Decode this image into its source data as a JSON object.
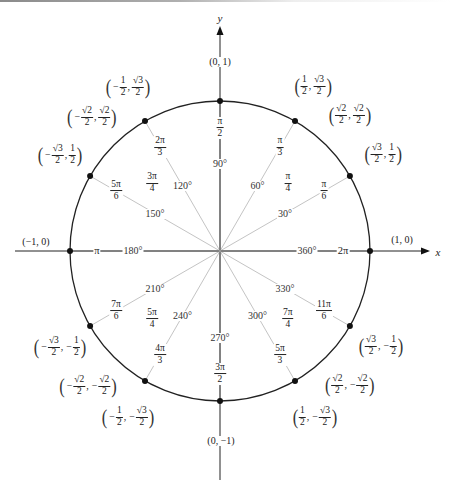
{
  "diagram": {
    "center": {
      "x": 220,
      "y": 251
    },
    "radius": 150,
    "colors": {
      "circle": "#222222",
      "axis": "#222222",
      "radius_line": "#c4c4c4",
      "dot": "#111111",
      "text": "#222222"
    },
    "axes": {
      "x_label": "x",
      "y_label": "y",
      "x_label_pos": {
        "x": 438,
        "y": 252
      },
      "y_label_pos": {
        "x": 220,
        "y": 18
      }
    },
    "axis_points": [
      {
        "label": "(0, 1)",
        "x": 220,
        "y": 62
      },
      {
        "label": "(1, 0)",
        "x": 402,
        "y": 240
      },
      {
        "label": "(0, −1)",
        "x": 221,
        "y": 441
      },
      {
        "label": "(−1, 0)",
        "x": 36,
        "y": 242
      }
    ],
    "angles": [
      {
        "deg": 0,
        "deg_label": "360°",
        "rad_num": "2π",
        "rad_den": "",
        "dot": true
      },
      {
        "deg": 30,
        "deg_label": "30°",
        "rad_num": "π",
        "rad_den": "6",
        "dot": true
      },
      {
        "deg": 45,
        "deg_label": "",
        "rad_num": "π",
        "rad_den": "4",
        "dot": false
      },
      {
        "deg": 60,
        "deg_label": "60°",
        "rad_num": "π",
        "rad_den": "3",
        "dot": true
      },
      {
        "deg": 90,
        "deg_label": "90°",
        "rad_num": "π",
        "rad_den": "2",
        "dot": true
      },
      {
        "deg": 120,
        "deg_label": "120°",
        "rad_num": "2π",
        "rad_den": "3",
        "dot": true
      },
      {
        "deg": 135,
        "deg_label": "",
        "rad_num": "3π",
        "rad_den": "4",
        "dot": false
      },
      {
        "deg": 150,
        "deg_label": "150°",
        "rad_num": "5π",
        "rad_den": "6",
        "dot": true
      },
      {
        "deg": 180,
        "deg_label": "180°",
        "rad_num": "π",
        "rad_den": "",
        "dot": true
      },
      {
        "deg": 210,
        "deg_label": "210°",
        "rad_num": "7π",
        "rad_den": "6",
        "dot": true
      },
      {
        "deg": 225,
        "deg_label": "",
        "rad_num": "5π",
        "rad_den": "4",
        "dot": false
      },
      {
        "deg": 240,
        "deg_label": "240°",
        "rad_num": "4π",
        "rad_den": "3",
        "dot": true
      },
      {
        "deg": 270,
        "deg_label": "270°",
        "rad_num": "3π",
        "rad_den": "2",
        "dot": true
      },
      {
        "deg": 300,
        "deg_label": "300°",
        "rad_num": "5π",
        "rad_den": "3",
        "dot": true
      },
      {
        "deg": 315,
        "deg_label": "",
        "rad_num": "7π",
        "rad_den": "4",
        "dot": false
      },
      {
        "deg": 330,
        "deg_label": "330°",
        "rad_num": "11π",
        "rad_den": "6",
        "dot": true
      }
    ],
    "coordinates": [
      {
        "angle": 30,
        "x_sign": "",
        "x_num": "√3",
        "x_den": "2",
        "y_sign": "",
        "y_num": "1",
        "y_den": "2",
        "pos": {
          "x": 383,
          "y": 154
        }
      },
      {
        "angle": 45,
        "x_sign": "",
        "x_num": "√2",
        "x_den": "2",
        "y_sign": "",
        "y_num": "√2",
        "y_den": "2",
        "pos": {
          "x": 350,
          "y": 115
        }
      },
      {
        "angle": 60,
        "x_sign": "",
        "x_num": "1",
        "x_den": "2",
        "y_sign": "",
        "y_num": "√3",
        "y_den": "2",
        "pos": {
          "x": 313,
          "y": 86
        }
      },
      {
        "angle": 120,
        "x_sign": "−",
        "x_num": "1",
        "x_den": "2",
        "y_sign": "",
        "y_num": "√3",
        "y_den": "2",
        "pos": {
          "x": 128,
          "y": 87
        }
      },
      {
        "angle": 135,
        "x_sign": "−",
        "x_num": "√2",
        "x_den": "2",
        "y_sign": "",
        "y_num": "√2",
        "y_den": "2",
        "pos": {
          "x": 92,
          "y": 117
        }
      },
      {
        "angle": 150,
        "x_sign": "−",
        "x_num": "√3",
        "x_den": "2",
        "y_sign": "",
        "y_num": "1",
        "y_den": "2",
        "pos": {
          "x": 60,
          "y": 155
        }
      },
      {
        "angle": 210,
        "x_sign": "−",
        "x_num": "√3",
        "x_den": "2",
        "y_sign": "−",
        "y_num": "1",
        "y_den": "2",
        "pos": {
          "x": 60,
          "y": 347
        }
      },
      {
        "angle": 225,
        "x_sign": "−",
        "x_num": "√2",
        "x_den": "2",
        "y_sign": "−",
        "y_num": "√2",
        "y_den": "2",
        "pos": {
          "x": 88,
          "y": 386
        }
      },
      {
        "angle": 240,
        "x_sign": "−",
        "x_num": "1",
        "x_den": "2",
        "y_sign": "−",
        "y_num": "√3",
        "y_den": "2",
        "pos": {
          "x": 128,
          "y": 417
        }
      },
      {
        "angle": 300,
        "x_sign": "",
        "x_num": "1",
        "x_den": "2",
        "y_sign": "−",
        "y_num": "√3",
        "y_den": "2",
        "pos": {
          "x": 315,
          "y": 417
        }
      },
      {
        "angle": 315,
        "x_sign": "",
        "x_num": "√2",
        "x_den": "2",
        "y_sign": "−",
        "y_num": "√2",
        "y_den": "2",
        "pos": {
          "x": 350,
          "y": 385
        }
      },
      {
        "angle": 330,
        "x_sign": "",
        "x_num": "√3",
        "x_den": "2",
        "y_sign": "−",
        "y_num": "1",
        "y_den": "2",
        "pos": {
          "x": 381,
          "y": 346
        }
      }
    ]
  }
}
